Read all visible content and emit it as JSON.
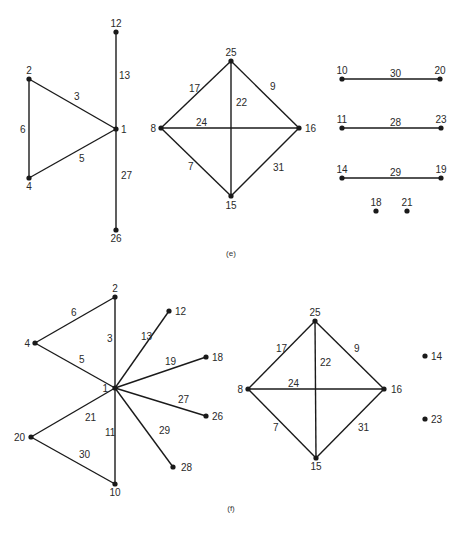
{
  "panels": [
    {
      "id": "e",
      "caption": "(e)",
      "caption_pos": [
        231,
        256
      ],
      "nodes": [
        {
          "id": "12",
          "x": 116,
          "y": 32,
          "lx": 116,
          "ly": 27,
          "anchor": "middle"
        },
        {
          "id": "2",
          "x": 29,
          "y": 79,
          "lx": 29,
          "ly": 74,
          "anchor": "middle"
        },
        {
          "id": "1",
          "x": 116,
          "y": 129,
          "lx": 121,
          "ly": 133,
          "anchor": "start"
        },
        {
          "id": "4",
          "x": 29,
          "y": 178,
          "lx": 29,
          "ly": 190,
          "anchor": "middle"
        },
        {
          "id": "26",
          "x": 116,
          "y": 230,
          "lx": 116,
          "ly": 242,
          "anchor": "middle"
        },
        {
          "id": "25",
          "x": 231,
          "y": 61,
          "lx": 231,
          "ly": 56,
          "anchor": "middle"
        },
        {
          "id": "8",
          "x": 161,
          "y": 128,
          "lx": 156,
          "ly": 132,
          "anchor": "end"
        },
        {
          "id": "16",
          "x": 299,
          "y": 128,
          "lx": 305,
          "ly": 132,
          "anchor": "start"
        },
        {
          "id": "15",
          "x": 231,
          "y": 196,
          "lx": 231,
          "ly": 209,
          "anchor": "middle"
        },
        {
          "id": "10",
          "x": 342,
          "y": 79,
          "lx": 342,
          "ly": 74,
          "anchor": "middle"
        },
        {
          "id": "20",
          "x": 440,
          "y": 79,
          "lx": 440,
          "ly": 74,
          "anchor": "middle"
        },
        {
          "id": "11",
          "x": 342,
          "y": 128,
          "lx": 342,
          "ly": 123,
          "anchor": "middle"
        },
        {
          "id": "23",
          "x": 441,
          "y": 128,
          "lx": 441,
          "ly": 123,
          "anchor": "middle"
        },
        {
          "id": "14",
          "x": 342,
          "y": 178,
          "lx": 342,
          "ly": 173,
          "anchor": "middle"
        },
        {
          "id": "19",
          "x": 441,
          "y": 178,
          "lx": 441,
          "ly": 173,
          "anchor": "middle"
        },
        {
          "id": "18",
          "x": 376,
          "y": 211,
          "lx": 376,
          "ly": 206,
          "anchor": "middle"
        },
        {
          "id": "21",
          "x": 407,
          "y": 211,
          "lx": 407,
          "ly": 206,
          "anchor": "middle"
        }
      ],
      "edges": [
        {
          "label": "13",
          "from": "12",
          "to": "1",
          "lx": 119,
          "ly": 79
        },
        {
          "label": "3",
          "from": "2",
          "to": "1",
          "lx": 74,
          "ly": 100
        },
        {
          "label": "6",
          "from": "2",
          "to": "4",
          "lx": 20,
          "ly": 133
        },
        {
          "label": "5",
          "from": "4",
          "to": "1",
          "lx": 79,
          "ly": 162
        },
        {
          "label": "27",
          "from": "1",
          "to": "26",
          "lx": 121,
          "ly": 179
        },
        {
          "label": "17",
          "from": "8",
          "to": "25",
          "lx": 189,
          "ly": 92
        },
        {
          "label": "9",
          "from": "25",
          "to": "16",
          "lx": 270,
          "ly": 90
        },
        {
          "label": "22",
          "from": "25",
          "to": "15",
          "lx": 236,
          "ly": 106
        },
        {
          "label": "24",
          "from": "8",
          "to": "16",
          "lx": 196,
          "ly": 126
        },
        {
          "label": "7",
          "from": "8",
          "to": "15",
          "lx": 188,
          "ly": 170
        },
        {
          "label": "31",
          "from": "16",
          "to": "15",
          "lx": 273,
          "ly": 171
        },
        {
          "label": "30",
          "from": "10",
          "to": "20",
          "lx": 390,
          "ly": 77
        },
        {
          "label": "28",
          "from": "11",
          "to": "23",
          "lx": 390,
          "ly": 126
        },
        {
          "label": "29",
          "from": "14",
          "to": "19",
          "lx": 390,
          "ly": 176
        }
      ]
    },
    {
      "id": "f",
      "caption": "(f)",
      "caption_pos": [
        231,
        511
      ],
      "nodes": [
        {
          "id": "2",
          "x": 115,
          "y": 297,
          "lx": 115,
          "ly": 292,
          "anchor": "middle"
        },
        {
          "id": "4",
          "x": 35,
          "y": 343,
          "lx": 30,
          "ly": 347,
          "anchor": "end"
        },
        {
          "id": "1",
          "x": 115,
          "y": 388,
          "lx": 108,
          "ly": 392,
          "anchor": "end"
        },
        {
          "id": "12",
          "x": 169,
          "y": 311,
          "lx": 175,
          "ly": 315,
          "anchor": "start"
        },
        {
          "id": "18",
          "x": 206,
          "y": 357,
          "lx": 212,
          "ly": 361,
          "anchor": "start"
        },
        {
          "id": "26",
          "x": 206,
          "y": 416,
          "lx": 212,
          "ly": 420,
          "anchor": "start"
        },
        {
          "id": "28",
          "x": 173,
          "y": 467,
          "lx": 181,
          "ly": 471,
          "anchor": "start"
        },
        {
          "id": "20",
          "x": 31,
          "y": 437,
          "lx": 25,
          "ly": 441,
          "anchor": "end"
        },
        {
          "id": "10",
          "x": 115,
          "y": 484,
          "lx": 115,
          "ly": 496,
          "anchor": "middle"
        },
        {
          "id": "25",
          "x": 315,
          "y": 321,
          "lx": 315,
          "ly": 316,
          "anchor": "middle"
        },
        {
          "id": "8",
          "x": 248,
          "y": 389,
          "lx": 243,
          "ly": 393,
          "anchor": "end"
        },
        {
          "id": "16",
          "x": 384,
          "y": 389,
          "lx": 391,
          "ly": 393,
          "anchor": "start"
        },
        {
          "id": "15",
          "x": 316,
          "y": 458,
          "lx": 316,
          "ly": 470,
          "anchor": "middle"
        },
        {
          "id": "14",
          "x": 425,
          "y": 356,
          "lx": 431,
          "ly": 360,
          "anchor": "start"
        },
        {
          "id": "23",
          "x": 425,
          "y": 419,
          "lx": 431,
          "ly": 423,
          "anchor": "start"
        }
      ],
      "edges": [
        {
          "label": "6",
          "from": "4",
          "to": "2",
          "lx": 71,
          "ly": 316
        },
        {
          "label": "3",
          "from": "2",
          "to": "1",
          "lx": 107,
          "ly": 342
        },
        {
          "label": "5",
          "from": "4",
          "to": "1",
          "lx": 79,
          "ly": 363
        },
        {
          "label": "13",
          "from": "1",
          "to": "12",
          "lx": 141,
          "ly": 340
        },
        {
          "label": "19",
          "from": "1",
          "to": "18",
          "lx": 165,
          "ly": 365
        },
        {
          "label": "27",
          "from": "1",
          "to": "26",
          "lx": 178,
          "ly": 403
        },
        {
          "label": "29",
          "from": "1",
          "to": "28",
          "lx": 159,
          "ly": 434
        },
        {
          "label": "21",
          "from": "1",
          "to": "20",
          "lx": 85,
          "ly": 421
        },
        {
          "label": "11",
          "from": "1",
          "to": "10",
          "lx": 105,
          "ly": 436
        },
        {
          "label": "30",
          "from": "20",
          "to": "10",
          "lx": 79,
          "ly": 458
        },
        {
          "label": "17",
          "from": "8",
          "to": "25",
          "lx": 276,
          "ly": 352
        },
        {
          "label": "9",
          "from": "25",
          "to": "16",
          "lx": 354,
          "ly": 352
        },
        {
          "label": "22",
          "from": "25",
          "to": "15",
          "lx": 320,
          "ly": 366
        },
        {
          "label": "24",
          "from": "8",
          "to": "16",
          "lx": 288,
          "ly": 387
        },
        {
          "label": "7",
          "from": "8",
          "to": "15",
          "lx": 273,
          "ly": 431
        },
        {
          "label": "31",
          "from": "16",
          "to": "15",
          "lx": 358,
          "ly": 431
        }
      ]
    }
  ]
}
